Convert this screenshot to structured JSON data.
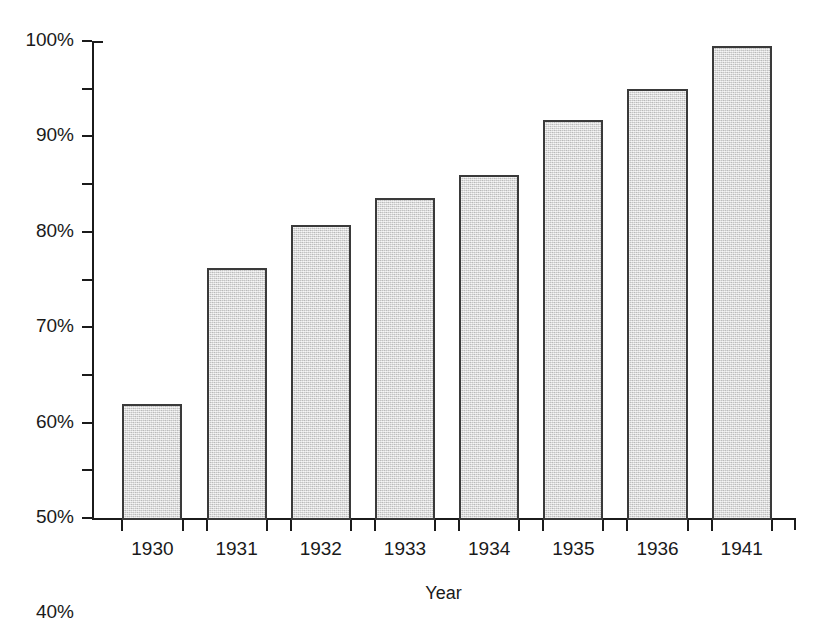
{
  "chart_data": {
    "type": "bar",
    "categories": [
      "1930",
      "1931",
      "1932",
      "1933",
      "1934",
      "1935",
      "1936",
      "1941"
    ],
    "values": [
      24,
      52.5,
      61.5,
      67,
      72,
      83.5,
      90,
      99
    ],
    "xlabel": "Year",
    "ylabel": "",
    "ylim": [
      0,
      100
    ],
    "ytick_labels": [
      "0%",
      "10%",
      "20%",
      "30%",
      "40%",
      "50%",
      "60%",
      "70%",
      "80%",
      "90%",
      "100%"
    ],
    "ytick_values": [
      0,
      10,
      20,
      30,
      40,
      50,
      60,
      70,
      80,
      90,
      100
    ],
    "grid": false,
    "legend": null,
    "bar_fill_color": "#d9d9d9",
    "bar_edge_color": "#3a3a3a",
    "axis_color": "#1b1b1b",
    "background_color": "#ffffff"
  },
  "title": {
    "visible_fragment": "",
    "note": "title row is cut off by the top edge of the screenshot"
  },
  "axes": {
    "x_axis_title": "Year"
  }
}
